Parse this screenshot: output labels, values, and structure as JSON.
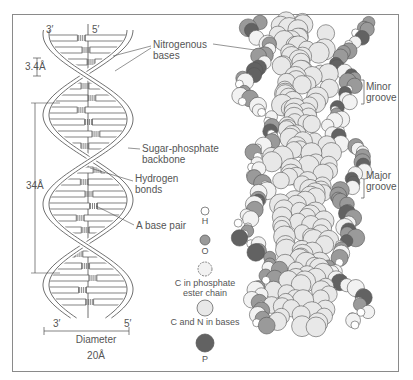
{
  "figure": {
    "helix_ends": {
      "top_left": "3′",
      "top_right": "5′",
      "bottom_left": "3′",
      "bottom_right": "5′"
    },
    "measurements": {
      "base_spacing": "3.4Å",
      "helix_turn": "34Å",
      "diameter_label": "Diameter",
      "diameter_value": "20Å"
    },
    "callouts": {
      "nitrogenous_bases": [
        "Nitrogenous",
        "bases"
      ],
      "sugar_phosphate_backbone": [
        "Sugar-phosphate",
        "backbone"
      ],
      "hydrogen_bonds": [
        "Hydrogen",
        "bonds"
      ],
      "base_pair": "A base pair",
      "minor_groove": [
        "Minor",
        "groove"
      ],
      "major_groove": [
        "Major",
        "groove"
      ]
    },
    "legend": [
      {
        "label": "H",
        "color": "#ffffff"
      },
      {
        "label": "O",
        "color": "#9a9a9a"
      },
      {
        "label": "C in phosphate ester chain",
        "lines": [
          "C in phosphate",
          "ester chain"
        ],
        "color": "#f2f2f2"
      },
      {
        "label": "C and N in bases",
        "color": "#ececec"
      },
      {
        "label": "P",
        "color": "#6a6a6a"
      }
    ],
    "colors": {
      "H": "#ffffff",
      "O": "#9a9a9a",
      "C_phosphate": "#f2f2f2",
      "CN_bases": "#e8e8e8",
      "P": "#626262",
      "line": "#4d4d4d"
    }
  }
}
